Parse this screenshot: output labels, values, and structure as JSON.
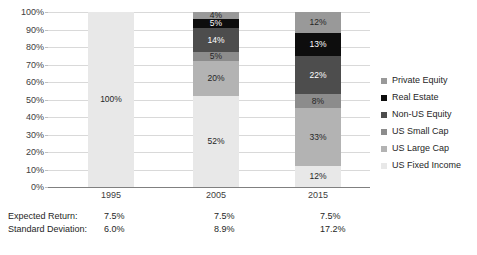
{
  "chart_data": {
    "type": "bar",
    "title": "",
    "subtitle": "",
    "xlabel": "",
    "ylabel": "",
    "categories": [
      "1995",
      "2005",
      "2015"
    ],
    "ylim": [
      0,
      100
    ],
    "ytick_labels": [
      "0%",
      "10%",
      "20%",
      "30%",
      "40%",
      "50%",
      "60%",
      "70%",
      "80%",
      "90%",
      "100%"
    ],
    "ytick_values": [
      0,
      10,
      20,
      30,
      40,
      50,
      60,
      70,
      80,
      90,
      100
    ],
    "grid": true,
    "stacked": true,
    "legend_position": "right",
    "legend_order_top_to_bottom": [
      "Private Equity",
      "Real Estate",
      "Non-US Equity",
      "US Small Cap",
      "US Large Cap",
      "US Fixed Income"
    ],
    "series": [
      {
        "name": "US Fixed Income",
        "color": "#e8e8e8",
        "text_color": "#262626",
        "values": [
          100,
          52,
          12
        ],
        "labels": [
          "100%",
          "52%",
          "12%"
        ]
      },
      {
        "name": "US Large Cap",
        "color": "#b3b3b3",
        "text_color": "#262626",
        "values": [
          0,
          20,
          33
        ],
        "labels": [
          "",
          "20%",
          "33%"
        ]
      },
      {
        "name": "US Small Cap",
        "color": "#8c8c8c",
        "text_color": "#262626",
        "values": [
          0,
          5,
          8
        ],
        "labels": [
          "",
          "5%",
          "8%"
        ]
      },
      {
        "name": "Non-US Equity",
        "color": "#4d4d4d",
        "text_color": "#ffffff",
        "values": [
          0,
          14,
          22
        ],
        "labels": [
          "",
          "14%",
          "22%"
        ]
      },
      {
        "name": "Real Estate",
        "color": "#0d0d0d",
        "text_color": "#ffffff",
        "values": [
          0,
          5,
          13
        ],
        "labels": [
          "",
          "5%",
          "13%"
        ]
      },
      {
        "name": "Private Equity",
        "color": "#999999",
        "text_color": "#262626",
        "values": [
          0,
          4,
          12
        ],
        "labels": [
          "",
          "4%",
          "12%"
        ]
      }
    ]
  },
  "legend": {
    "items": [
      {
        "label": "Private Equity",
        "color": "#999999"
      },
      {
        "label": "Real Estate",
        "color": "#0d0d0d"
      },
      {
        "label": "Non-US Equity",
        "color": "#4d4d4d"
      },
      {
        "label": "US Small Cap",
        "color": "#8c8c8c"
      },
      {
        "label": "US Large Cap",
        "color": "#b3b3b3"
      },
      {
        "label": "US Fixed Income",
        "color": "#e8e8e8"
      }
    ]
  },
  "stats_table": {
    "rows": [
      {
        "label": "Expected Return:",
        "values": [
          "7.5%",
          "7.5%",
          "7.5%"
        ]
      },
      {
        "label": "Standard Deviation:",
        "values": [
          "6.0%",
          "8.9%",
          "17.2%"
        ]
      }
    ]
  }
}
